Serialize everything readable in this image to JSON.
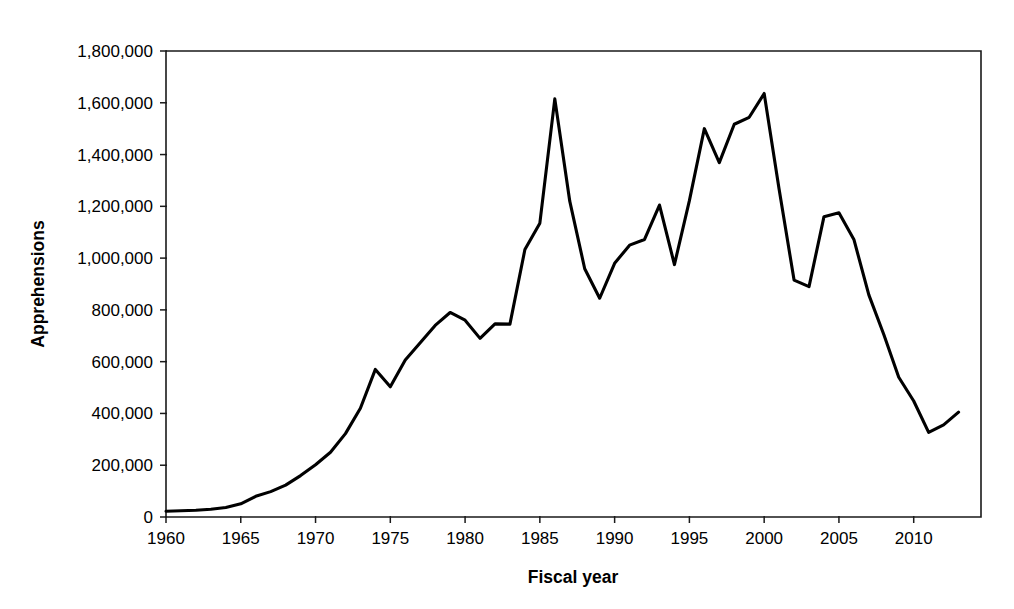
{
  "chart_data": {
    "type": "line",
    "title": "",
    "xlabel": "Fiscal year",
    "ylabel": "Apprehensions",
    "xlim": [
      1960,
      2014.5
    ],
    "ylim": [
      0,
      1800000
    ],
    "grid": false,
    "legend": null,
    "x_tick_labels": [
      "1960",
      "1965",
      "1970",
      "1975",
      "1980",
      "1985",
      "1990",
      "1995",
      "2000",
      "2005",
      "2010"
    ],
    "x_ticks": [
      1960,
      1965,
      1970,
      1975,
      1980,
      1985,
      1990,
      1995,
      2000,
      2005,
      2010
    ],
    "y_tick_labels": [
      "0",
      "200,000",
      "400,000",
      "600,000",
      "800,000",
      "1,000,000",
      "1,200,000",
      "1,400,000",
      "1,600,000",
      "1,800,000"
    ],
    "y_ticks": [
      0,
      200000,
      400000,
      600000,
      800000,
      1000000,
      1200000,
      1400000,
      1600000,
      1800000
    ],
    "series": [
      {
        "name": "Apprehensions",
        "color": "#000000",
        "x": [
          1960,
          1961,
          1962,
          1963,
          1964,
          1965,
          1966,
          1967,
          1968,
          1969,
          1970,
          1971,
          1972,
          1973,
          1974,
          1975,
          1976,
          1977,
          1978,
          1979,
          1980,
          1981,
          1982,
          1983,
          1984,
          1985,
          1986,
          1987,
          1988,
          1989,
          1990,
          1991,
          1992,
          1993,
          1994,
          1995,
          1996,
          1997,
          1998,
          1999,
          2000,
          2001,
          2002,
          2003,
          2004,
          2005,
          2006,
          2007,
          2008,
          2009,
          2010,
          2011,
          2012,
          2013
        ],
        "values": [
          22000,
          24000,
          26000,
          30000,
          37000,
          51000,
          80000,
          98000,
          123000,
          160000,
          202000,
          250000,
          322000,
          420000,
          570000,
          503000,
          606000,
          673000,
          740000,
          790000,
          760000,
          690000,
          746000,
          745000,
          1033000,
          1135000,
          1615000,
          1220000,
          959000,
          845000,
          980000,
          1050000,
          1072000,
          1205000,
          975000,
          1222000,
          1500000,
          1369000,
          1517000,
          1544000,
          1636000,
          1266000,
          915000,
          890000,
          1160000,
          1175000,
          1072000,
          858000,
          705000,
          540000,
          448000,
          327000,
          356000,
          405000
        ]
      }
    ]
  },
  "axis": {
    "y_title": "Apprehensions",
    "x_title": "Fiscal year"
  }
}
